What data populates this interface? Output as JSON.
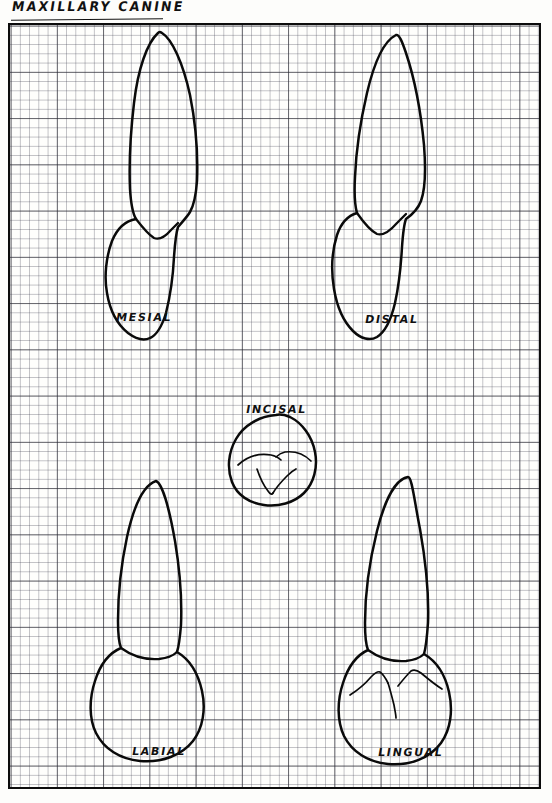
{
  "page": {
    "title": "MAXILLARY CANINE",
    "paper": "graph-paper",
    "ink_color": "#0a0a0a",
    "paper_color": "#fefefc",
    "grid": {
      "minor_cell_px": 9.25,
      "major_every_cells": 5,
      "minor_color": "#46465585",
      "major_color": "#282830",
      "frame_color": "#0c0c0c"
    }
  },
  "views": [
    {
      "id": "mesial",
      "label": "MESIAL"
    },
    {
      "id": "distal",
      "label": "DISTAL"
    },
    {
      "id": "incisal",
      "label": "INCISAL"
    },
    {
      "id": "labial",
      "label": "LABIAL"
    },
    {
      "id": "lingual",
      "label": "LINGUAL"
    }
  ]
}
